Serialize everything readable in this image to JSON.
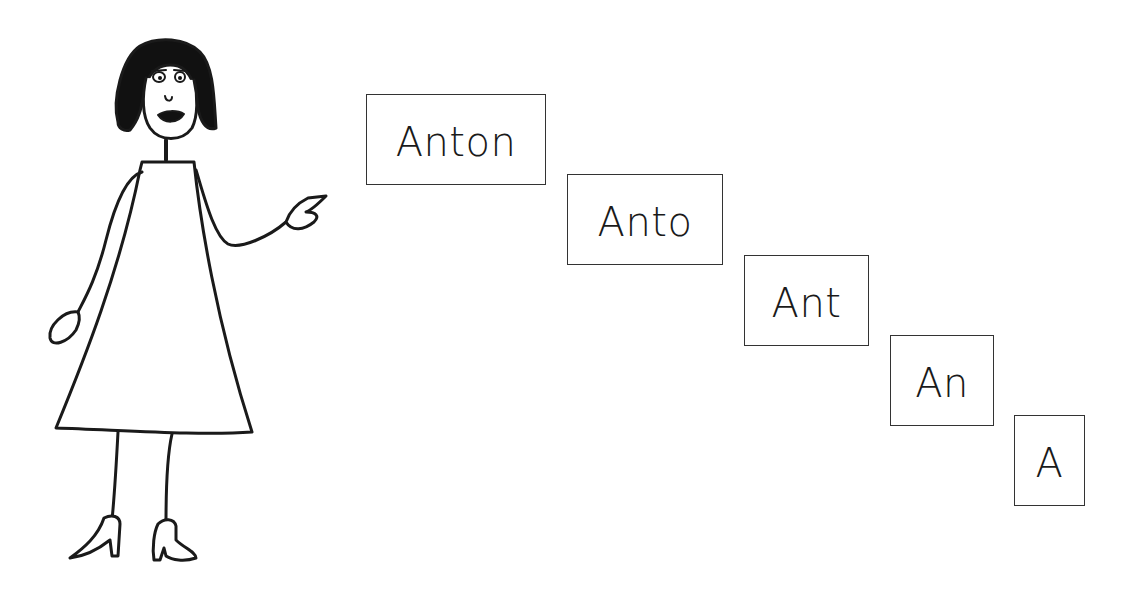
{
  "illustration": {
    "figure": "cartoon-woman-pointing",
    "colors": {
      "ink": "#1a1a1a",
      "background": "#ffffff",
      "box_border": "#333333"
    }
  },
  "word_sequence": [
    {
      "text": "Anton"
    },
    {
      "text": "Anto"
    },
    {
      "text": "Ant"
    },
    {
      "text": "An"
    },
    {
      "text": "A"
    }
  ]
}
